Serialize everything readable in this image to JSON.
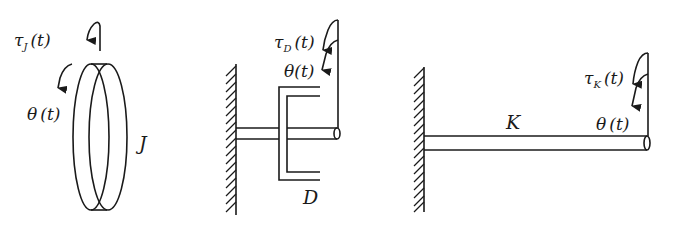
{
  "diagram": {
    "elements": [
      {
        "id": "inertia",
        "symbol_label": "J",
        "torque_label": {
          "main": "τ",
          "sub": "J",
          "arg": "(t)"
        },
        "angle_label": {
          "main": "θ",
          "arg": "(t)"
        }
      },
      {
        "id": "damper",
        "symbol_label": "D",
        "torque_label": {
          "main": "τ",
          "sub": "D",
          "arg": "(t)"
        },
        "angle_label": {
          "main": "θ",
          "arg": "(t)"
        }
      },
      {
        "id": "spring",
        "symbol_label": "K",
        "torque_label": {
          "main": "τ",
          "sub": "K",
          "arg": "(t)"
        },
        "angle_label": {
          "main": "θ",
          "arg": "(t)"
        }
      }
    ],
    "colors": {
      "ink": "#1a1a1a",
      "background": "#ffffff"
    }
  }
}
